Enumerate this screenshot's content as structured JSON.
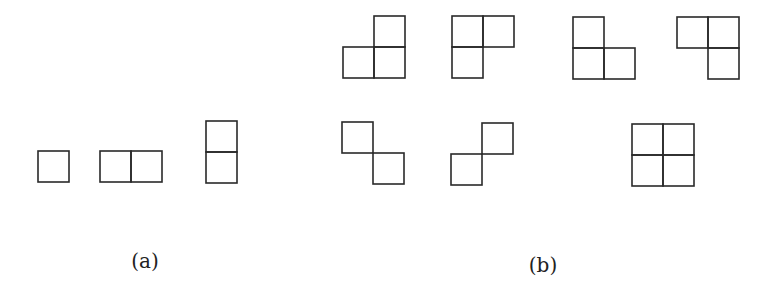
{
  "diagram": {
    "type": "polyominoes",
    "cell_size": 31,
    "colors": {
      "stroke": "#2a2a2a",
      "background": "#ffffff"
    },
    "panels": [
      {
        "label": "(a)",
        "label_pos": [
          145,
          268
        ],
        "shapes": [
          {
            "name": "monomino",
            "cells": [
              [
                38,
                151
              ]
            ]
          },
          {
            "name": "domino-horizontal",
            "cells": [
              [
                100,
                151
              ],
              [
                131,
                151
              ]
            ]
          },
          {
            "name": "domino-vertical",
            "cells": [
              [
                206,
                121
              ],
              [
                206,
                152
              ]
            ]
          }
        ]
      },
      {
        "label": "(b)",
        "label_pos": [
          543,
          272
        ],
        "shapes": [
          {
            "name": "l-tromino-1",
            "cells": [
              [
                374,
                16
              ],
              [
                343,
                47
              ],
              [
                374,
                47
              ]
            ]
          },
          {
            "name": "l-tromino-2",
            "cells": [
              [
                452,
                16
              ],
              [
                483,
                16
              ],
              [
                452,
                47
              ]
            ]
          },
          {
            "name": "l-tromino-3",
            "cells": [
              [
                573,
                17
              ],
              [
                573,
                48
              ],
              [
                604,
                48
              ]
            ]
          },
          {
            "name": "l-tromino-4",
            "cells": [
              [
                677,
                17
              ],
              [
                708,
                17
              ],
              [
                708,
                48
              ]
            ]
          },
          {
            "name": "diagonal-pair-1",
            "cells": [
              [
                342,
                122
              ],
              [
                373,
                153
              ]
            ]
          },
          {
            "name": "diagonal-pair-2",
            "cells": [
              [
                482,
                123
              ],
              [
                451,
                154
              ]
            ]
          },
          {
            "name": "square-tetromino",
            "cells": [
              [
                632,
                124
              ],
              [
                663,
                124
              ],
              [
                632,
                155
              ],
              [
                663,
                155
              ]
            ]
          }
        ]
      }
    ]
  }
}
